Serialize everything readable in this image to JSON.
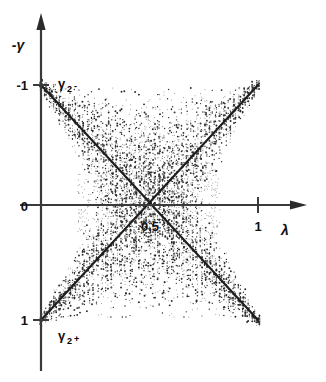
{
  "figure": {
    "background_color": "#ffffff",
    "ink_color": "#1d1d1d",
    "axis_color": "#3a3a3a"
  },
  "chart_data": {
    "type": "scatter",
    "title": "",
    "subtitle": "",
    "xlabel": "λ",
    "ylabel": "-γ",
    "xlim": [
      0,
      1.12
    ],
    "ylim": [
      -1.35,
      1.35
    ],
    "grid": false,
    "legend_position": "inline-annotation",
    "x_ticks": [
      {
        "value": 0.5,
        "label": "0,5"
      },
      {
        "value": 1.0,
        "label": "1"
      }
    ],
    "y_ticks": [
      {
        "value": -1.0,
        "label": "-1"
      },
      {
        "value": 0.0,
        "label": "0"
      },
      {
        "value": 1.0,
        "label": "1"
      }
    ],
    "annotations": [
      {
        "text": "γ",
        "sub": "2",
        "sup": "-",
        "x": 0.07,
        "y": -1.05,
        "name": "gamma-2-minus-label"
      },
      {
        "text": "γ",
        "sub": "2",
        "sup": "+",
        "x": 0.07,
        "y": 1.12,
        "name": "gamma-2-plus-label"
      }
    ],
    "series": [
      {
        "name": "γ₂₋",
        "type": "line",
        "description": "descending branch from (0,-1) to (1,1)",
        "x": [
          0.0,
          1.0
        ],
        "values": [
          -1.0,
          1.0
        ],
        "slope": 2.0,
        "intercept": -1.0,
        "color": "#1d1d1d"
      },
      {
        "name": "γ₂₊",
        "type": "line",
        "description": "ascending branch from (0,1) to (1,-1)",
        "x": [
          0.0,
          1.0
        ],
        "values": [
          1.0,
          -1.0
        ],
        "slope": -2.0,
        "intercept": 1.0,
        "color": "#1d1d1d"
      },
      {
        "name": "measurement scatter",
        "type": "scatter",
        "description": "dense dotted vertical columns of data points straddling both branches, spread widest near the crossing at λ = 0,5",
        "crossing_point": {
          "x": 0.5,
          "y": 0.0
        },
        "spread_profile": [
          {
            "x": 0.0,
            "half_width": 0.04
          },
          {
            "x": 0.1,
            "half_width": 0.14
          },
          {
            "x": 0.2,
            "half_width": 0.28
          },
          {
            "x": 0.3,
            "half_width": 0.46
          },
          {
            "x": 0.4,
            "half_width": 0.62
          },
          {
            "x": 0.5,
            "half_width": 0.7
          },
          {
            "x": 0.6,
            "half_width": 0.62
          },
          {
            "x": 0.7,
            "half_width": 0.46
          },
          {
            "x": 0.8,
            "half_width": 0.28
          },
          {
            "x": 0.9,
            "half_width": 0.14
          },
          {
            "x": 1.0,
            "half_width": 0.04
          }
        ],
        "color": "#2a2a2a"
      }
    ]
  }
}
